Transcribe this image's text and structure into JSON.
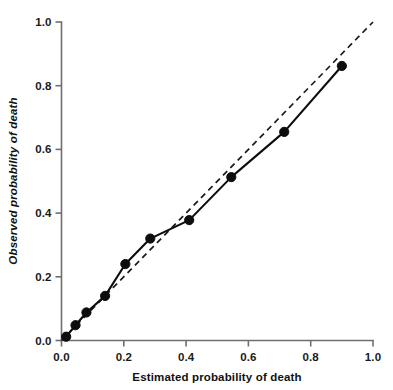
{
  "chart_data": {
    "type": "line",
    "title": "",
    "subtitle": "",
    "xlabel": "Estimated probability of death",
    "ylabel": "Observed probability of death",
    "xlim": [
      0.0,
      1.0
    ],
    "ylim": [
      0.0,
      1.0
    ],
    "xticks": [
      0.0,
      0.2,
      0.4,
      0.6,
      0.8,
      1.0
    ],
    "yticks": [
      0.0,
      0.2,
      0.4,
      0.6,
      0.8,
      1.0
    ],
    "xtick_labels": [
      "0.0",
      "0.2",
      "0.4",
      "0.6",
      "0.8",
      "1.0"
    ],
    "ytick_labels": [
      "0.0",
      "0.2",
      "0.4",
      "0.6",
      "0.8",
      "1.0"
    ],
    "grid": false,
    "legend": null,
    "legend_position": "none",
    "series": [
      {
        "name": "Observed vs estimated probability",
        "style": "solid-line-with-markers",
        "color": "#0d0d0d",
        "marker": "filled-circle",
        "x": [
          0.015,
          0.045,
          0.08,
          0.14,
          0.205,
          0.285,
          0.41,
          0.545,
          0.715,
          0.9
        ],
        "y": [
          0.012,
          0.048,
          0.088,
          0.14,
          0.24,
          0.32,
          0.378,
          0.513,
          0.655,
          0.862
        ]
      },
      {
        "name": "Perfect calibration reference",
        "style": "dashed-line",
        "color": "#1a1a1a",
        "marker": "none",
        "x": [
          0.0,
          1.0
        ],
        "y": [
          0.0,
          1.0
        ]
      }
    ]
  },
  "axes": {
    "x_tick_labels": [
      "0.0",
      "0.2",
      "0.4",
      "0.6",
      "0.8",
      "1.0"
    ],
    "y_tick_labels": [
      "0.0",
      "0.2",
      "0.4",
      "0.6",
      "0.8",
      "1.0"
    ],
    "x_title": "Estimated probability of death",
    "y_title": "Observed probability of death"
  },
  "colors": {
    "background": "#ffffff",
    "axis": "#6f6f6f",
    "data": "#0d0d0d",
    "reference": "#1a1a1a",
    "text": "#111111"
  }
}
